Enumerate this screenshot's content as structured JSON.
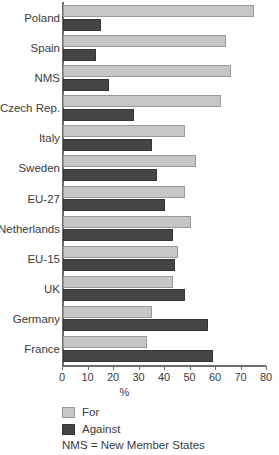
{
  "chart_data": {
    "type": "bar",
    "orientation": "horizontal",
    "title": "",
    "xlabel": "%",
    "ylabel": "",
    "xlim": [
      0,
      80
    ],
    "xticks": [
      0,
      10,
      20,
      30,
      40,
      50,
      60,
      70,
      80
    ],
    "grid": false,
    "legend_position": "bottom-left",
    "categories": [
      "Poland",
      "Spain",
      "NMS",
      "Czech Rep.",
      "Italy",
      "Sweden",
      "EU-27",
      "Netherlands",
      "EU-15",
      "UK",
      "Germany",
      "France"
    ],
    "series": [
      {
        "name": "For",
        "color": "#c6c6c6",
        "values": [
          75,
          64,
          66,
          62,
          48,
          52,
          48,
          50,
          45,
          43,
          35,
          33
        ]
      },
      {
        "name": "Against",
        "color": "#454545",
        "values": [
          15,
          13,
          18,
          28,
          35,
          37,
          40,
          43,
          44,
          48,
          57,
          59
        ]
      }
    ],
    "annotations": [
      "NMS = New Member States"
    ]
  },
  "axis": {
    "x_title": "%",
    "tick_labels": [
      "0",
      "10",
      "20",
      "30",
      "40",
      "50",
      "60",
      "70",
      "80"
    ]
  },
  "legend": {
    "items": [
      {
        "label": "For",
        "color": "#c6c6c6"
      },
      {
        "label": "Against",
        "color": "#454545"
      }
    ]
  },
  "footnote": "NMS = New Member States"
}
